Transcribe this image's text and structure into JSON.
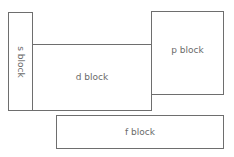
{
  "diagram": {
    "blocks": [
      {
        "id": "s",
        "label": "s block"
      },
      {
        "id": "d",
        "label": "d block"
      },
      {
        "id": "p",
        "label": "p block"
      },
      {
        "id": "f",
        "label": "f block"
      }
    ],
    "colors": {
      "border": "#6e6e6e",
      "text": "#6a6a6a",
      "background": "#ffffff"
    }
  }
}
